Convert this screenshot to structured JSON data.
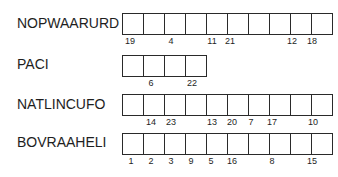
{
  "rows": [
    {
      "label": "NOPWAARURD",
      "cell_count": 10,
      "top": 13,
      "label_top": 15,
      "numbers": [
        {
          "text": "19",
          "x": 130
        },
        {
          "text": "4",
          "x": 171
        },
        {
          "text": "11",
          "x": 212
        },
        {
          "text": "21",
          "x": 230
        },
        {
          "text": "12",
          "x": 292
        },
        {
          "text": "18",
          "x": 312
        }
      ]
    },
    {
      "label": "PACI",
      "cell_count": 4,
      "top": 55,
      "label_top": 56,
      "numbers": [
        {
          "text": "6",
          "x": 151
        },
        {
          "text": "22",
          "x": 192
        }
      ]
    },
    {
      "label": "NATLINCUFO",
      "cell_count": 10,
      "top": 94,
      "label_top": 96,
      "numbers": [
        {
          "text": "14",
          "x": 151
        },
        {
          "text": "23",
          "x": 171
        },
        {
          "text": "13",
          "x": 212
        },
        {
          "text": "20",
          "x": 232
        },
        {
          "text": "7",
          "x": 251
        },
        {
          "text": "17",
          "x": 272
        },
        {
          "text": "10",
          "x": 313
        }
      ]
    },
    {
      "label": "BOVRAAHELI",
      "cell_count": 10,
      "top": 133,
      "label_top": 134,
      "numbers": [
        {
          "text": "1",
          "x": 131
        },
        {
          "text": "2",
          "x": 151
        },
        {
          "text": "3",
          "x": 171
        },
        {
          "text": "9",
          "x": 191
        },
        {
          "text": "5",
          "x": 211
        },
        {
          "text": "16",
          "x": 232
        },
        {
          "text": "8",
          "x": 272
        },
        {
          "text": "15",
          "x": 312
        }
      ]
    }
  ]
}
